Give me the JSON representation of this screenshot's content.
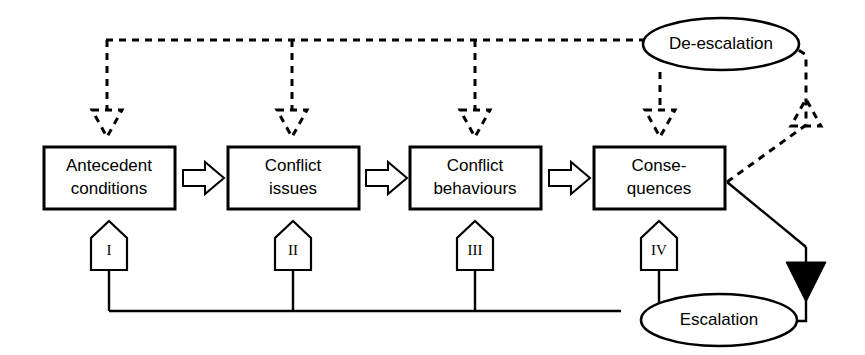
{
  "diagram": {
    "stroke_color": "#000000",
    "background_color": "#ffffff",
    "stages": [
      {
        "id": "antecedent-conditions",
        "label_line1": "Antecedent",
        "label_line2": "conditions",
        "numeral": "I"
      },
      {
        "id": "conflict-issues",
        "label_line1": "Conflict",
        "label_line2": "issues",
        "numeral": "II"
      },
      {
        "id": "conflict-behaviours",
        "label_line1": "Conflict",
        "label_line2": "behaviours",
        "numeral": "III"
      },
      {
        "id": "consequences",
        "label_line1": "Conse-",
        "label_line2": "quences",
        "numeral": "IV"
      }
    ],
    "feedback_nodes": [
      {
        "id": "de-escalation",
        "label": "De-escalation",
        "line_style": "dashed"
      },
      {
        "id": "escalation",
        "label": "Escalation",
        "line_style": "solid"
      }
    ],
    "connectors": {
      "stage_flow": "hollow-block-arrow",
      "de_escalation_feedback": "dashed-open-arrowhead",
      "escalation_feedback": "solid-filled-arrowhead"
    }
  }
}
